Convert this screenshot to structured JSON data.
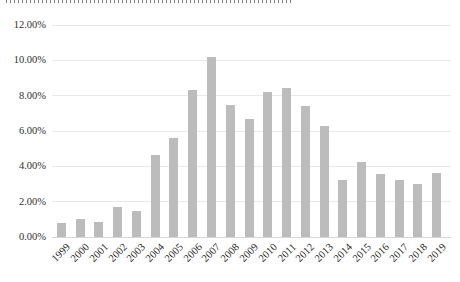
{
  "page": {
    "description_note": "Excel-style gray bar chart; chart title is cut off at the top edge of the screenshot and is illegible"
  },
  "chart_data": {
    "type": "bar",
    "title": "",
    "title_clipped_at_top": true,
    "categories": [
      "1999",
      "2000",
      "2001",
      "2002",
      "2003",
      "2004",
      "2005",
      "2006",
      "2007",
      "2008",
      "2009",
      "2010",
      "2011",
      "2012",
      "2013",
      "2014",
      "2015",
      "2016",
      "2017",
      "2018",
      "2019"
    ],
    "values": [
      0.8,
      1.0,
      0.85,
      1.7,
      1.45,
      4.65,
      5.6,
      8.3,
      10.2,
      7.45,
      6.7,
      8.2,
      8.45,
      7.4,
      6.3,
      3.2,
      4.25,
      3.55,
      3.2,
      3.0,
      3.6
    ],
    "value_unit": "%",
    "xlabel": "",
    "ylabel": "",
    "ylim": [
      0,
      12
    ],
    "y_ticks": [
      "12.00%",
      "10.00%",
      "8.00%",
      "6.00%",
      "4.00%",
      "2.00%",
      "0.00%"
    ],
    "y_tick_values": [
      12,
      10,
      8,
      6,
      4,
      2,
      0
    ],
    "grid": true,
    "legend": "none",
    "bar_color": "#bcbcbc",
    "gridline_color": "#e9e9e9",
    "axis_line_color": "#d6d6d6",
    "tick_label_color": "#2f2f2f",
    "background_color": "#ffffff"
  }
}
